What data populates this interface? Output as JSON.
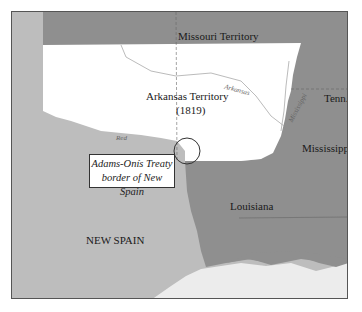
{
  "map": {
    "regions": [
      {
        "id": "missouri-territory",
        "label": "Missouri Territory",
        "color": "#8f8f8f"
      },
      {
        "id": "arkansas-territory",
        "label": "Arkansas Territory",
        "sublabel": "(1819)",
        "color": "#ffffff"
      },
      {
        "id": "tennessee",
        "label": "Tenn.",
        "color": "#8f8f8f"
      },
      {
        "id": "mississippi",
        "label": "Mississippi",
        "color": "#8f8f8f"
      },
      {
        "id": "louisiana",
        "label": "Louisiana",
        "color": "#8f8f8f"
      },
      {
        "id": "new-spain",
        "label": "NEW SPAIN",
        "color": "#bdbdbd"
      },
      {
        "id": "gulf",
        "label": "",
        "color": "#ececec"
      }
    ],
    "rivers": [
      {
        "id": "red",
        "label": "Red"
      },
      {
        "id": "arkansas",
        "label": "Arkansas"
      },
      {
        "id": "mississippi",
        "label": "Mississippi"
      }
    ],
    "callout": {
      "line1": "Adams-Onís Treaty",
      "line2": "border of New Spain"
    },
    "colors": {
      "frame": "#555555",
      "us_states": "#8f8f8f",
      "new_spain": "#bdbdbd",
      "territory": "#ffffff",
      "water": "#ececec"
    }
  }
}
